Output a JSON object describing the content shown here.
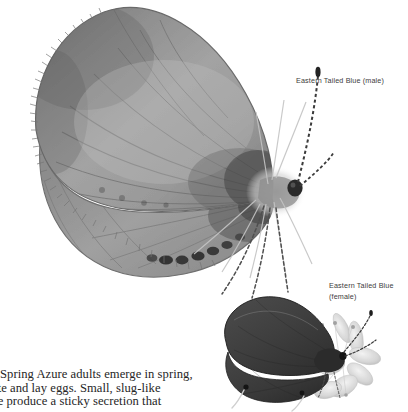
{
  "page": {
    "background_color": "#ffffff",
    "width": 408,
    "height": 412,
    "style": "grayscale field-guide plate"
  },
  "labels": {
    "male": "Eastern Tailed Blue (male)",
    "female": "Eastern Tailed Blue\n(female)"
  },
  "caption": {
    "line1": "Spring Azure adults emerge in spring,",
    "line2": "ate and lay eggs. Small, slug-like",
    "line3": "ae produce a sticky secretion that"
  },
  "figures": {
    "male": {
      "name": "Eastern Tailed Blue (male)",
      "view": "lateral, wings closed",
      "wing_color": "#9b9b9b",
      "wing_shade_dark": "#6e6e6e",
      "vein_color": "#6a6a6a",
      "fringe_color": "#8a8a8a",
      "marginal_spot_color": "#2c2c2c",
      "eye_color": "#2a2a2a",
      "antenna_color": "#3b3b3b"
    },
    "female": {
      "name": "Eastern Tailed Blue (female)",
      "view": "lateral, wings closed, on flower",
      "wing_color": "#3f3f3f",
      "wing_shade_dark": "#2a2a2a",
      "spot_color": "#161616",
      "flower_color": "#d8d8d8",
      "flower_shade": "#b4b4b4"
    }
  },
  "colors": {
    "text_label": "#3c3c3c",
    "text_caption": "#262626",
    "background": "#ffffff"
  }
}
